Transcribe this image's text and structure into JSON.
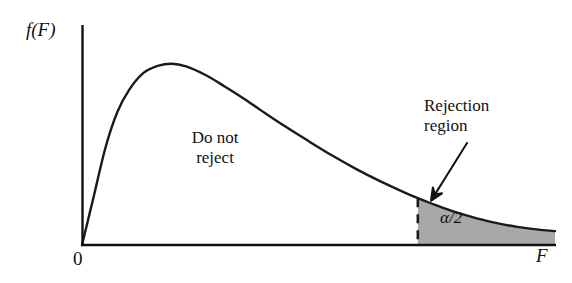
{
  "figure": {
    "labels": {
      "ylabel": "f(F)",
      "xlabel": "F",
      "origin": "0",
      "accept_region": "Do not\nreject",
      "reject_region": "Rejection\nregion",
      "alpha": "α/2"
    },
    "colors": {
      "curve": "#1a1a1a",
      "axis": "#111111",
      "shading": "#a8a8a8",
      "background": "#ffffff",
      "text": "#111111"
    }
  },
  "chart_data": {
    "type": "area",
    "title": "",
    "subtitle": "",
    "xlabel": "F",
    "ylabel": "f(F)",
    "xlim": [
      0,
      10
    ],
    "ylim": [
      0,
      1
    ],
    "grid": false,
    "legend": null,
    "series": [
      {
        "name": "f(F) density",
        "x": [
          0.0,
          0.25,
          0.5,
          0.75,
          1.0,
          1.3,
          1.6,
          1.9,
          2.2,
          2.6,
          3.0,
          3.4,
          3.8,
          4.3,
          4.8,
          5.3,
          5.8,
          6.3,
          6.8,
          7.1,
          7.4,
          7.8,
          8.2,
          8.7,
          9.2,
          9.7,
          10.0
        ],
        "y": [
          0.0,
          0.265,
          0.53,
          0.72,
          0.84,
          0.93,
          0.968,
          0.98,
          0.965,
          0.92,
          0.86,
          0.795,
          0.725,
          0.64,
          0.56,
          0.482,
          0.41,
          0.345,
          0.286,
          0.253,
          0.223,
          0.186,
          0.155,
          0.122,
          0.098,
          0.082,
          0.075
        ]
      }
    ],
    "peak": {
      "x": 1.9,
      "y": 0.98
    },
    "shaded_region": {
      "label": "α/2",
      "annotation": "Rejection\nregion",
      "x_start": 7.1,
      "x_end": 10.0,
      "boundary_style": "dashed",
      "fill": "#a8a8a8"
    },
    "unshaded_region": {
      "label": "Do not\nreject",
      "x_start": 0.0,
      "x_end": 7.1
    },
    "annotations": [
      {
        "text": "Rejection\nregion",
        "type": "arrow",
        "arrow_from": {
          "x": 8.15,
          "y": 0.555
        },
        "arrow_to": {
          "x": 7.38,
          "y": 0.24
        }
      },
      {
        "text": "Do not\nreject",
        "type": "text",
        "x": 2.77,
        "y": 0.5
      },
      {
        "text": "α/2",
        "type": "text",
        "x": 8.15,
        "y": 0.12
      }
    ]
  }
}
